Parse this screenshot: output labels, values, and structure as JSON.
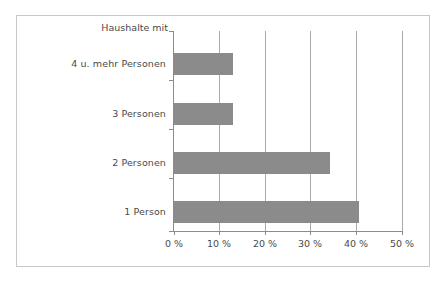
{
  "chart_data": {
    "type": "bar",
    "orientation": "horizontal",
    "title": "",
    "subtitle": "",
    "axis_title": "Haushalte mit",
    "xlabel": "",
    "ylabel": "Haushalte mit",
    "categories": [
      "1 Person",
      "2 Personen",
      "3 Personen",
      "4 u. mehr Personen"
    ],
    "values": [
      40.6,
      34.2,
      13.0,
      13.0
    ],
    "value_unit": "%",
    "xlim": [
      0,
      50
    ],
    "xticks": [
      0,
      10,
      20,
      30,
      40,
      50
    ],
    "xtick_labels": [
      "0 %",
      "10 %",
      "20 %",
      "30 %",
      "40 %",
      "50 %"
    ],
    "grid": "vertical",
    "legend": "none",
    "bar_color": "#8b8b8b",
    "gridline_color": "#aaaaaa",
    "axis_color": "#8c8c8c",
    "frame_color": "#c8c8c8",
    "text_color": "#4a4a4a",
    "background": "#ffffff"
  }
}
